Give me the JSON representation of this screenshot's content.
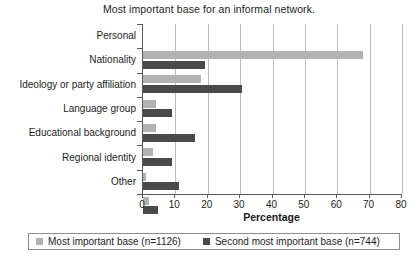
{
  "chart_data": {
    "type": "bar",
    "orientation": "horizontal",
    "title": "Most important base for an informal network.",
    "xlabel": "Percentage",
    "ylabel": "",
    "xlim": [
      0,
      80
    ],
    "xticks": [
      0,
      10,
      20,
      30,
      40,
      50,
      60,
      70,
      80
    ],
    "grid": true,
    "legend_position": "bottom",
    "categories": [
      "Personal",
      "Nationality",
      "Ideology or party affiliation",
      "Language group",
      "Educational background",
      "Regional identity",
      "Other"
    ],
    "series": [
      {
        "name": "Most important base (n=1126)",
        "color": "#b3b3b3",
        "values": [
          68,
          18,
          4,
          4,
          3,
          1,
          2
        ]
      },
      {
        "name": "Second most important base (n=744)",
        "color": "#4a4a4a",
        "values": [
          19,
          30.5,
          9,
          16,
          9,
          11,
          4.5
        ]
      }
    ]
  },
  "legend": {
    "items": [
      {
        "label": "Most important base (n=1126)",
        "color": "#b3b3b3"
      },
      {
        "label": "Second most important base (n=744)",
        "color": "#4a4a4a"
      }
    ]
  }
}
